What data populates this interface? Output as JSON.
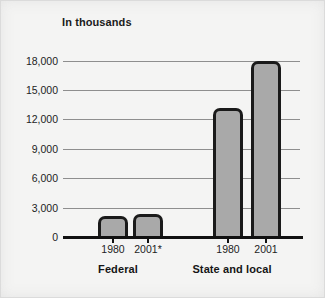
{
  "chart_data": {
    "type": "bar",
    "title": "In thousands",
    "xlabel": "",
    "ylabel": "",
    "ylim": [
      0,
      19500
    ],
    "yticks": [
      0,
      3000,
      6000,
      9000,
      12000,
      15000,
      18000
    ],
    "ytick_labels": [
      "0",
      "3,000",
      "6,000",
      "9,000",
      "12,000",
      "15,000",
      "18,000"
    ],
    "grid": true,
    "legend": "none",
    "groups": [
      {
        "label": "Federal",
        "bars": [
          {
            "category": "1980",
            "value": 2100
          },
          {
            "category": "2001*",
            "value": 2300
          }
        ]
      },
      {
        "label": "State and local",
        "bars": [
          {
            "category": "1980",
            "value": 13200
          },
          {
            "category": "2001",
            "value": 18000
          }
        ]
      }
    ],
    "categories": [
      "1980",
      "2001*",
      "1980",
      "2001"
    ],
    "values": [
      2100,
      2300,
      13200,
      18000
    ],
    "colors": {
      "bar_fill": "#a9a9a9",
      "bar_outline": "#1a1a1a",
      "gridline": "#8e8e8e",
      "axis": "#111111",
      "background": "#f4f4f3",
      "text": "#1d1d1d"
    }
  }
}
